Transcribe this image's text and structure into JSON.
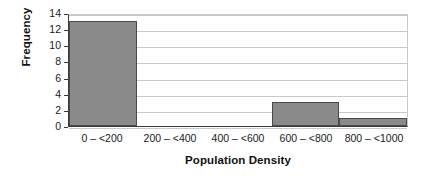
{
  "chart_data": {
    "type": "bar",
    "title": "",
    "subtitle": "",
    "xlabel": "Population Density",
    "ylabel": "Frequency",
    "categories": [
      "0 – <200",
      "200 – <400",
      "400 – <600",
      "600 – <800",
      "800 – <1000"
    ],
    "values": [
      13,
      0,
      0,
      3,
      1
    ],
    "series": [
      {
        "name": "Frequency",
        "values": [
          13,
          0,
          0,
          3,
          1
        ]
      }
    ],
    "ylim": [
      0,
      14
    ],
    "ytick_step": 2,
    "yticks": [
      0,
      2,
      4,
      6,
      8,
      10,
      12,
      14
    ],
    "ytick_labels": [
      "0",
      "2",
      "4",
      "6",
      "8",
      "10",
      "12",
      "14"
    ],
    "xlim": [
      0,
      1000
    ],
    "bin_width": 200,
    "grid": true,
    "grid_axis": "y",
    "legend": false,
    "legend_position": "none",
    "annotations": [],
    "bar_fill_color": "#8a8a8a",
    "bar_border_color": "#4a4a4a",
    "gridline_color": "#c9c9c9",
    "axis_color": "#3b3b3b",
    "background_color": "#ffffff"
  }
}
